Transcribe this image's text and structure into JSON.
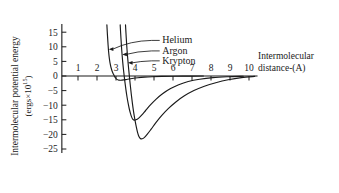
{
  "chart_data": {
    "type": "line",
    "title": "",
    "subtitle": "",
    "xlabel": "Intermolecular distance-(A)",
    "xlabel_line1": "Intermolecular",
    "xlabel_line2": "distance-(A)",
    "ylabel": "Intermolecular potential energy (ergs×10¹⁵)",
    "ylabel_line1": "Intermolecular potential energy",
    "ylabel_line2_prefix": "(ergs×10",
    "ylabel_line2_exponent": "15",
    "ylabel_line2_suffix": ")",
    "xlim": [
      0,
      10.6
    ],
    "ylim": [
      -27,
      18
    ],
    "xticks": [
      1,
      2,
      3,
      4,
      5,
      6,
      7,
      8,
      9,
      10
    ],
    "xtick_labels": [
      "1",
      "2",
      "3",
      "4",
      "5",
      "6",
      "7",
      "8",
      "9",
      "10"
    ],
    "yticks": [
      15,
      10,
      5,
      0,
      -5,
      -10,
      -15,
      -20,
      -25
    ],
    "ytick_labels": [
      "15",
      "10",
      "5",
      "0",
      "−5",
      "−10",
      "−15",
      "−20",
      "−25"
    ],
    "grid": false,
    "legend_position": "inline-annotations",
    "line_color": "#1a1a1a",
    "axis_color": "#1a1a1a",
    "background_color": "#ffffff",
    "series": [
      {
        "name": "Helium",
        "label": "Helium",
        "sigma": 2.56,
        "r_min": 2.95,
        "epsilon_min": -1.45,
        "points": [
          [
            2.52,
            17.5
          ],
          [
            2.55,
            14.0
          ],
          [
            2.58,
            11.0
          ],
          [
            2.61,
            8.4
          ],
          [
            2.65,
            6.0
          ],
          [
            2.7,
            4.0
          ],
          [
            2.76,
            2.4
          ],
          [
            2.83,
            1.1
          ],
          [
            2.9,
            0.2
          ],
          [
            2.97,
            -0.6
          ],
          [
            3.05,
            -1.15
          ],
          [
            3.15,
            -1.42
          ],
          [
            3.25,
            -1.45
          ],
          [
            3.4,
            -1.35
          ],
          [
            3.6,
            -1.12
          ],
          [
            3.85,
            -0.85
          ],
          [
            4.15,
            -0.6
          ],
          [
            4.5,
            -0.4
          ],
          [
            4.9,
            -0.26
          ],
          [
            5.4,
            -0.15
          ],
          [
            6.0,
            -0.08
          ],
          [
            6.8,
            -0.03
          ],
          [
            7.6,
            -0.01
          ]
        ]
      },
      {
        "name": "Argon",
        "label": "Argon",
        "sigma": 3.4,
        "r_min": 3.86,
        "epsilon_min": -15.1,
        "points": [
          [
            3.22,
            17.5
          ],
          [
            3.26,
            13.0
          ],
          [
            3.3,
            9.0
          ],
          [
            3.35,
            5.0
          ],
          [
            3.4,
            1.8
          ],
          [
            3.46,
            -1.6
          ],
          [
            3.52,
            -4.6
          ],
          [
            3.58,
            -7.2
          ],
          [
            3.64,
            -9.4
          ],
          [
            3.7,
            -11.3
          ],
          [
            3.76,
            -12.8
          ],
          [
            3.82,
            -14.0
          ],
          [
            3.88,
            -14.8
          ],
          [
            3.95,
            -15.1
          ],
          [
            4.05,
            -15.0
          ],
          [
            4.18,
            -14.5
          ],
          [
            4.35,
            -13.4
          ],
          [
            4.55,
            -11.9
          ],
          [
            4.8,
            -10.0
          ],
          [
            5.1,
            -8.0
          ],
          [
            5.45,
            -6.1
          ],
          [
            5.85,
            -4.4
          ],
          [
            6.3,
            -3.0
          ],
          [
            6.8,
            -1.9
          ],
          [
            7.4,
            -1.1
          ],
          [
            8.1,
            -0.55
          ],
          [
            8.9,
            -0.25
          ],
          [
            9.7,
            -0.08
          ]
        ]
      },
      {
        "name": "Krypton",
        "label": "Krypton",
        "sigma": 3.62,
        "r_min": 4.15,
        "epsilon_min": -21.5,
        "points": [
          [
            3.5,
            17.5
          ],
          [
            3.54,
            13.0
          ],
          [
            3.58,
            9.0
          ],
          [
            3.63,
            5.0
          ],
          [
            3.68,
            1.5
          ],
          [
            3.74,
            -2.4
          ],
          [
            3.8,
            -6.0
          ],
          [
            3.86,
            -9.2
          ],
          [
            3.92,
            -12.0
          ],
          [
            3.99,
            -14.8
          ],
          [
            4.06,
            -17.2
          ],
          [
            4.13,
            -19.2
          ],
          [
            4.2,
            -20.6
          ],
          [
            4.28,
            -21.4
          ],
          [
            4.38,
            -21.5
          ],
          [
            4.5,
            -21.0
          ],
          [
            4.65,
            -19.9
          ],
          [
            4.85,
            -18.2
          ],
          [
            5.1,
            -16.0
          ],
          [
            5.4,
            -13.6
          ],
          [
            5.75,
            -11.2
          ],
          [
            6.15,
            -8.9
          ],
          [
            6.6,
            -6.8
          ],
          [
            7.1,
            -5.0
          ],
          [
            7.65,
            -3.5
          ],
          [
            8.25,
            -2.3
          ],
          [
            8.9,
            -1.3
          ],
          [
            9.6,
            -0.55
          ],
          [
            10.3,
            -0.15
          ]
        ]
      }
    ],
    "annotations": [
      {
        "label": "Helium",
        "text_x": 5.3,
        "text_y": 12.6,
        "arrow_to_x": 2.62,
        "arrow_to_y": 9.2
      },
      {
        "label": "Argon",
        "text_x": 5.3,
        "text_y": 9.0,
        "arrow_to_x": 3.33,
        "arrow_to_y": 7.4
      },
      {
        "label": "Krypton",
        "text_x": 5.3,
        "text_y": 5.6,
        "arrow_to_x": 3.63,
        "arrow_to_y": 4.5
      }
    ]
  }
}
